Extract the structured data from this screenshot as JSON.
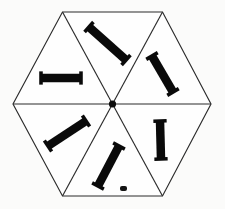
{
  "figure": {
    "shape_name": "hexagon",
    "sector_count": 6,
    "background_color": "#fbfbfa",
    "line_color": "#2b2b2b",
    "bar_color": "#0a0a0a",
    "canvas": {
      "width": 225,
      "height": 209
    }
  },
  "chart_data": {
    "type": "diagram",
    "xlabel": "",
    "ylabel": "",
    "grid": false,
    "legend": "none",
    "hexagon": {
      "center": {
        "x": 112.5,
        "y": 104
      },
      "vertices": [
        {
          "label": "left",
          "x": 13,
          "y": 104
        },
        {
          "label": "top-left",
          "x": 62.5,
          "y": 12
        },
        {
          "label": "top-right",
          "x": 162.5,
          "y": 12
        },
        {
          "label": "right",
          "x": 211,
          "y": 104
        },
        {
          "label": "bottom-right",
          "x": 162.5,
          "y": 196
        },
        {
          "label": "bottom-left",
          "x": 62.5,
          "y": 196
        }
      ],
      "center_dot_radius": 3.6
    },
    "sectors": [
      {
        "name": "top",
        "index": 0,
        "bar": {
          "x1": 89,
          "y1": 27,
          "x2": 126,
          "y2": 60,
          "thickness": 8.5,
          "angle_deg": 41.7,
          "orientation": "diagonal-down-right"
        }
      },
      {
        "name": "upper-right",
        "index": 1,
        "bar": {
          "x1": 152,
          "y1": 56,
          "x2": 173,
          "y2": 92,
          "thickness": 8.5,
          "angle_deg": 59.7,
          "orientation": "steep-down-right"
        }
      },
      {
        "name": "lower-right",
        "index": 2,
        "bar": {
          "x1": 160,
          "y1": 121,
          "x2": 161,
          "y2": 159,
          "thickness": 8.5,
          "angle_deg": 88.5,
          "orientation": "vertical"
        }
      },
      {
        "name": "bottom",
        "index": 3,
        "bar": {
          "x1": 119,
          "y1": 146,
          "x2": 98,
          "y2": 186,
          "thickness": 8.5,
          "angle_deg": 117.7,
          "orientation": "steep-down-left"
        }
      },
      {
        "name": "lower-left",
        "index": 4,
        "bar": {
          "x1": 86,
          "y1": 121,
          "x2": 48,
          "y2": 146,
          "thickness": 8.5,
          "angle_deg": 146.7,
          "orientation": "diagonal-down-left"
        }
      },
      {
        "name": "upper-left",
        "index": 5,
        "bar": {
          "x1": 41,
          "y1": 78,
          "x2": 81,
          "y2": 78,
          "thickness": 8.5,
          "angle_deg": 0,
          "orientation": "horizontal"
        }
      }
    ]
  }
}
